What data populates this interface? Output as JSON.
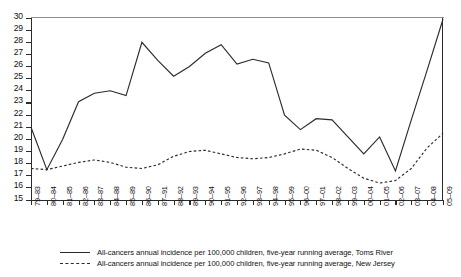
{
  "chart_data": {
    "type": "line",
    "title": "",
    "subtitle": "",
    "xlabel": "",
    "ylabel": "",
    "ylim": [
      15,
      30
    ],
    "ytick_step": 1,
    "yticks": [
      30,
      29,
      28,
      27,
      26,
      25,
      24,
      23,
      22,
      21,
      20,
      19,
      18,
      17,
      16,
      15
    ],
    "grid": false,
    "legend_position": "bottom",
    "categories": [
      "79–83",
      "80–84",
      "81–85",
      "82–86",
      "83–87",
      "84–88",
      "85–89",
      "86–90",
      "87–91",
      "88–92",
      "89–93",
      "90–94",
      "91–95",
      "92–96",
      "93–97",
      "94–98",
      "95–99",
      "96–00",
      "97–01",
      "98–02",
      "99–03",
      "00–04",
      "01–05",
      "02–06",
      "03–07",
      "04–08",
      "05–09"
    ],
    "series": [
      {
        "name": "All-cancers annual incidence per 100,000 children, five-year running average, Toms River",
        "style": "solid",
        "color": "#2b2b2b",
        "values": [
          21.0,
          17.5,
          20.0,
          23.1,
          23.8,
          24.0,
          23.6,
          28.0,
          26.5,
          25.2,
          26.0,
          27.1,
          27.8,
          26.2,
          26.6,
          26.3,
          22.0,
          20.8,
          21.7,
          21.6,
          20.2,
          18.8,
          20.2,
          17.4,
          21.6,
          25.7,
          29.9
        ]
      },
      {
        "name": "All-cancers annual incidence per 100,000 children, five-year running average, New Jersey",
        "style": "dashed",
        "color": "#2b2b2b",
        "values": [
          17.6,
          17.5,
          17.8,
          18.1,
          18.3,
          18.1,
          17.7,
          17.6,
          17.9,
          18.6,
          19.0,
          19.1,
          18.8,
          18.5,
          18.4,
          18.5,
          18.8,
          19.2,
          19.1,
          18.5,
          17.6,
          16.8,
          16.4,
          16.6,
          17.6,
          19.3,
          20.5
        ]
      }
    ]
  },
  "legend": {
    "items": [
      {
        "swatch": "solid-line",
        "label": "All-cancers annual incidence per 100,000 children, five-year running average, Toms River"
      },
      {
        "swatch": "dashed-line",
        "label": "All-cancers annual incidence per 100,000 children, five-year running average, New Jersey"
      }
    ]
  }
}
